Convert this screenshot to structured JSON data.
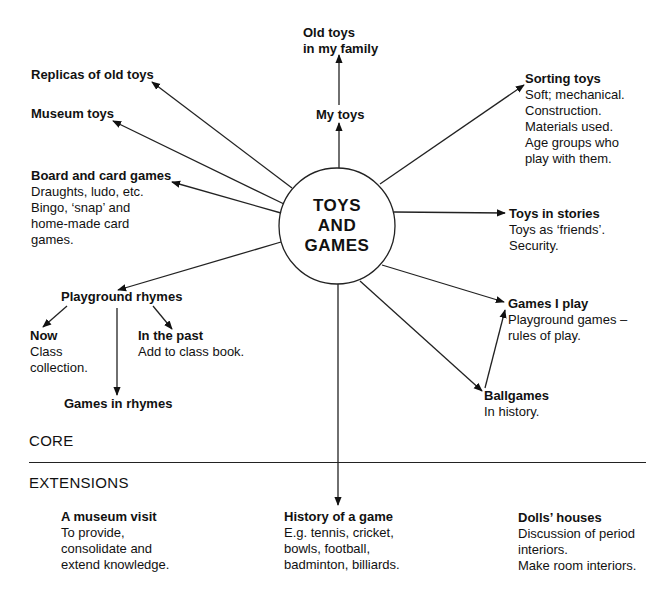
{
  "center": {
    "lines": [
      "TOYS",
      "AND",
      "GAMES"
    ]
  },
  "nodes": {
    "old_toys_family": {
      "title_lines": [
        "Old toys",
        "in my family"
      ]
    },
    "replicas": {
      "title": "Replicas of old toys"
    },
    "museum_toys": {
      "title": "Museum toys"
    },
    "my_toys": {
      "title": "My toys"
    },
    "sorting_toys": {
      "title": "Sorting toys",
      "desc_lines": [
        "Soft; mechanical.",
        "Construction.",
        "Materials used.",
        "Age groups who",
        "play with them."
      ]
    },
    "board_card": {
      "title": "Board and card games",
      "desc_lines": [
        "Draughts, ludo, etc.",
        "Bingo, ‘snap’ and",
        "home-made card",
        "games."
      ]
    },
    "toys_stories": {
      "title": "Toys in stories",
      "desc_lines": [
        "Toys as ‘friends’.",
        "Security."
      ]
    },
    "playground_rhymes": {
      "title": "Playground rhymes"
    },
    "games_i_play": {
      "title": "Games I play",
      "desc_lines": [
        "Playground games –",
        "rules of play."
      ]
    },
    "now": {
      "title": "Now",
      "desc_lines": [
        "Class",
        "collection."
      ]
    },
    "in_the_past": {
      "title": "In the past",
      "desc_lines": [
        "Add to class book."
      ]
    },
    "games_in_rhymes": {
      "title": "Games in rhymes"
    },
    "ballgames": {
      "title": "Ballgames",
      "desc_lines": [
        "In history."
      ]
    }
  },
  "sections": {
    "core": "CORE",
    "extensions": "EXTENSIONS"
  },
  "extensions": {
    "museum_visit": {
      "title": "A museum visit",
      "desc_lines": [
        "To provide,",
        "consolidate and",
        "extend knowledge."
      ]
    },
    "history_game": {
      "title": "History of a game",
      "desc_lines": [
        "E.g. tennis, cricket,",
        "bowls, football,",
        "badminton, billiards."
      ]
    },
    "dolls_houses": {
      "title": "Dolls’ houses",
      "desc_lines": [
        "Discussion of period",
        "interiors.",
        "Make room interiors."
      ]
    }
  }
}
